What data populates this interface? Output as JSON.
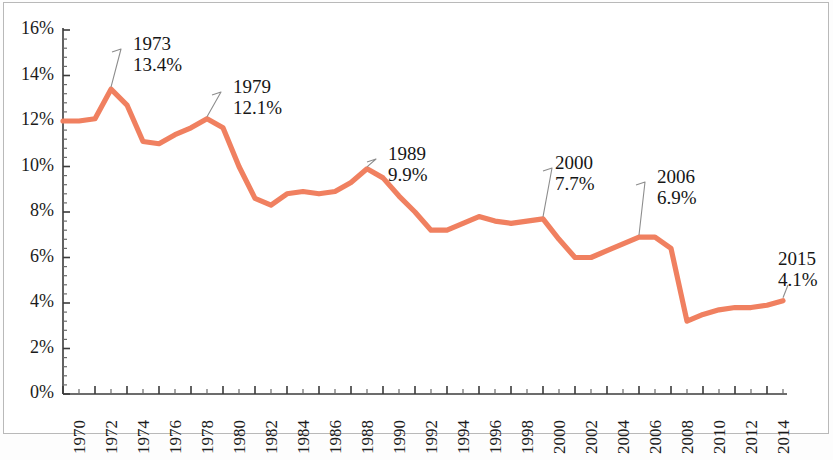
{
  "chart_data": {
    "type": "line",
    "title": "",
    "subtitle": "",
    "xlabel": "",
    "ylabel": "",
    "xlim": [
      1970,
      2015
    ],
    "ylim": [
      0,
      16
    ],
    "grid": false,
    "legend": "none",
    "line_color": "#F08060",
    "axis_color": "#3b3b3b",
    "frame_color": "#b9b9b9",
    "background": "#ffffff",
    "y_tick_labels": [
      "0%",
      "2%",
      "4%",
      "6%",
      "8%",
      "10%",
      "12%",
      "14%",
      "16%"
    ],
    "y_tick_values": [
      0,
      2,
      4,
      6,
      8,
      10,
      12,
      14,
      16
    ],
    "y_minor_ticks_per_interval": 5,
    "x_tick_labels": [
      "1970",
      "1972",
      "1974",
      "1976",
      "1978",
      "1980",
      "1982",
      "1984",
      "1986",
      "1988",
      "1990",
      "1992",
      "1994",
      "1996",
      "1998",
      "2000",
      "2002",
      "2004",
      "2006",
      "2008",
      "2010",
      "2012",
      "2014"
    ],
    "x_tick_values": [
      1970,
      1972,
      1974,
      1976,
      1978,
      1980,
      1982,
      1984,
      1986,
      1988,
      1990,
      1992,
      1994,
      1996,
      1998,
      2000,
      2002,
      2004,
      2006,
      2008,
      2010,
      2012,
      2014
    ],
    "x": [
      1970,
      1971,
      1972,
      1973,
      1974,
      1975,
      1976,
      1977,
      1978,
      1979,
      1980,
      1981,
      1982,
      1983,
      1984,
      1985,
      1986,
      1987,
      1988,
      1989,
      1990,
      1991,
      1992,
      1993,
      1994,
      1995,
      1996,
      1997,
      1998,
      1999,
      2000,
      2001,
      2002,
      2003,
      2004,
      2005,
      2006,
      2007,
      2008,
      2009,
      2010,
      2011,
      2012,
      2013,
      2014,
      2015
    ],
    "values": [
      12.0,
      12.0,
      12.1,
      13.4,
      12.7,
      11.1,
      11.0,
      11.4,
      11.7,
      12.1,
      11.7,
      10.0,
      8.6,
      8.3,
      8.8,
      8.9,
      8.8,
      8.9,
      9.3,
      9.9,
      9.5,
      8.7,
      8.0,
      7.2,
      7.2,
      7.5,
      7.8,
      7.6,
      7.5,
      7.6,
      7.7,
      6.8,
      6.0,
      6.0,
      6.3,
      6.6,
      6.9,
      6.9,
      6.4,
      3.2,
      3.5,
      3.7,
      3.8,
      3.8,
      3.9,
      4.1
    ],
    "annotations": [
      {
        "id": "a1973",
        "year": "1973",
        "value": "13.4%",
        "point_x": 1973,
        "point_y": 13.4
      },
      {
        "id": "a1979",
        "year": "1979",
        "value": "12.1%",
        "point_x": 1979,
        "point_y": 12.1
      },
      {
        "id": "a1989",
        "year": "1989",
        "value": "9.9%",
        "point_x": 1989,
        "point_y": 9.9
      },
      {
        "id": "a2000",
        "year": "2000",
        "value": "7.7%",
        "point_x": 2000,
        "point_y": 7.7
      },
      {
        "id": "a2006",
        "year": "2006",
        "value": "6.9%",
        "point_x": 2006,
        "point_y": 6.9
      },
      {
        "id": "a2015",
        "year": "2015",
        "value": "4.1%",
        "point_x": 2015,
        "point_y": 4.1
      }
    ]
  }
}
